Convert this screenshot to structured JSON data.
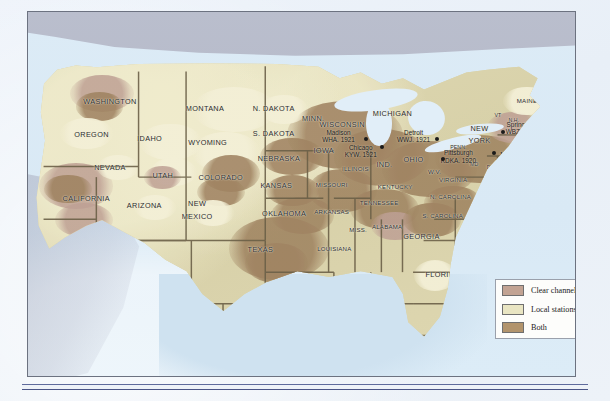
{
  "map": {
    "title": "Early U.S. radio stations",
    "regions_canada": "Canada",
    "states": [
      {
        "name": "WASHINGTON",
        "x": 14.5,
        "y": 14.5,
        "size": "state"
      },
      {
        "name": "OREGON",
        "x": 11.0,
        "y": 26.0,
        "size": "state"
      },
      {
        "name": "IDAHO",
        "x": 22.0,
        "y": 27.5,
        "size": "state"
      },
      {
        "name": "MONTANA",
        "x": 32.5,
        "y": 17.0,
        "size": "state"
      },
      {
        "name": "N. DAKOTA",
        "x": 45.5,
        "y": 17.0,
        "size": "state"
      },
      {
        "name": "S. DAKOTA",
        "x": 45.5,
        "y": 25.5,
        "size": "state"
      },
      {
        "name": "WYOMING",
        "x": 33.0,
        "y": 29.0,
        "size": "state"
      },
      {
        "name": "NEVADA",
        "x": 14.5,
        "y": 37.5,
        "size": "state"
      },
      {
        "name": "UTAH",
        "x": 24.5,
        "y": 40.5,
        "size": "state"
      },
      {
        "name": "COLORADO",
        "x": 35.5,
        "y": 41.0,
        "size": "state"
      },
      {
        "name": "NEBRASKA",
        "x": 46.5,
        "y": 34.5,
        "size": "state"
      },
      {
        "name": "KANSAS",
        "x": 46.0,
        "y": 44.0,
        "size": "state"
      },
      {
        "name": "CALIFORNIA",
        "x": 10.0,
        "y": 48.5,
        "size": "state"
      },
      {
        "name": "ARIZONA",
        "x": 21.0,
        "y": 51.0,
        "size": "state"
      },
      {
        "name": "NEW",
        "x": 31.0,
        "y": 50.5,
        "size": "state"
      },
      {
        "name": "MEXICO",
        "x": 31.0,
        "y": 55.0,
        "size": "state"
      },
      {
        "name": "OKLAHOMA",
        "x": 47.5,
        "y": 54.0,
        "size": "state"
      },
      {
        "name": "TEXAS",
        "x": 43.0,
        "y": 66.5,
        "size": "state"
      },
      {
        "name": "MINN.",
        "x": 53.0,
        "y": 20.5,
        "size": "state"
      },
      {
        "name": "WISCONSIN",
        "x": 58.5,
        "y": 22.5,
        "size": "state"
      },
      {
        "name": "IOWA",
        "x": 55.0,
        "y": 31.5,
        "size": "state"
      },
      {
        "name": "MISSOURI",
        "x": 56.5,
        "y": 43.5,
        "size": "sm"
      },
      {
        "name": "ILLINOIS",
        "x": 61.0,
        "y": 38.0,
        "size": "sm"
      },
      {
        "name": "MICHIGAN",
        "x": 68.0,
        "y": 18.5,
        "size": "state"
      },
      {
        "name": "IND.",
        "x": 66.5,
        "y": 36.5,
        "size": "state"
      },
      {
        "name": "OHIO",
        "x": 72.0,
        "y": 35.0,
        "size": "state"
      },
      {
        "name": "ARKANSAS",
        "x": 56.5,
        "y": 53.0,
        "size": "sm"
      },
      {
        "name": "LOUISIANA",
        "x": 57.0,
        "y": 66.0,
        "size": "sm"
      },
      {
        "name": "MISS.",
        "x": 61.5,
        "y": 59.5,
        "size": "sm"
      },
      {
        "name": "ALABAMA",
        "x": 67.0,
        "y": 58.5,
        "size": "sm"
      },
      {
        "name": "TENNESSEE",
        "x": 65.5,
        "y": 50.0,
        "size": "sm"
      },
      {
        "name": "KENTUCKY",
        "x": 68.5,
        "y": 44.5,
        "size": "sm"
      },
      {
        "name": "GEORGIA",
        "x": 73.5,
        "y": 62.0,
        "size": "state"
      },
      {
        "name": "FLORIDA",
        "x": 77.5,
        "y": 75.5,
        "size": "state"
      },
      {
        "name": "S. CAROLINA",
        "x": 77.5,
        "y": 54.5,
        "size": "sm"
      },
      {
        "name": "N. CAROLINA",
        "x": 79.0,
        "y": 48.0,
        "size": "sm"
      },
      {
        "name": "VIRGINIA",
        "x": 79.5,
        "y": 42.0,
        "size": "sm"
      },
      {
        "name": "W.V.",
        "x": 76.0,
        "y": 39.0,
        "size": "sm"
      },
      {
        "name": "PENN.",
        "x": 80.5,
        "y": 30.5,
        "size": "xs"
      },
      {
        "name": "NEW",
        "x": 84.5,
        "y": 24.0,
        "size": "state"
      },
      {
        "name": "YORK",
        "x": 84.5,
        "y": 28.0,
        "size": "state"
      },
      {
        "name": "MAINE",
        "x": 93.5,
        "y": 14.0,
        "size": "sm"
      },
      {
        "name": "VT",
        "x": 88.0,
        "y": 19.5,
        "size": "xs"
      },
      {
        "name": "N.H.",
        "x": 91.0,
        "y": 21.0,
        "size": "xs"
      },
      {
        "name": "MASS.",
        "x": 93.5,
        "y": 26.5,
        "size": "xs"
      },
      {
        "name": "R.I.",
        "x": 93.0,
        "y": 29.5,
        "size": "xs"
      },
      {
        "name": "CONN.",
        "x": 92.5,
        "y": 32.5,
        "size": "xs"
      },
      {
        "name": "N.J.",
        "x": 90.5,
        "y": 38.0,
        "size": "sm"
      },
      {
        "name": "MD",
        "x": 83.5,
        "y": 36.5,
        "size": "xs"
      },
      {
        "name": "DEL.",
        "x": 87.0,
        "y": 37.5,
        "size": "xs"
      }
    ],
    "stations": [
      {
        "city": "Madison",
        "call": "WHA. 1921",
        "x": 57.8,
        "y": 26.3,
        "dot_x": 63.0,
        "dot_y": 27.6
      },
      {
        "city": "Chicago",
        "call": "KYW. 1921",
        "x": 62.0,
        "y": 31.6,
        "dot_x": 66.0,
        "dot_y": 30.2
      },
      {
        "city": "Detroit",
        "call": "WWJ. 1921",
        "x": 72.0,
        "y": 26.3,
        "dot_x": 76.5,
        "dot_y": 27.4
      },
      {
        "city": "Pittsburgh",
        "call": "KDKA. 1920",
        "x": 80.5,
        "y": 33.5,
        "dot_x": 77.5,
        "dot_y": 34.6
      },
      {
        "city": "Newark",
        "call": "WJZ. 1921",
        "x": 90.5,
        "y": 34.0,
        "dot_x": 87.3,
        "dot_y": 32.4
      },
      {
        "city": "Springfield",
        "call": "WBZ. 1921",
        "x": 92.5,
        "y": 23.5,
        "dot_x": 89.0,
        "dot_y": 25.0
      }
    ]
  },
  "legend": {
    "items": [
      {
        "label": "Clear channel stations",
        "color": "#c2a393"
      },
      {
        "label": "Local stations",
        "color": "#e9e5c2"
      },
      {
        "label": "Both",
        "color": "#b2946c"
      }
    ]
  }
}
